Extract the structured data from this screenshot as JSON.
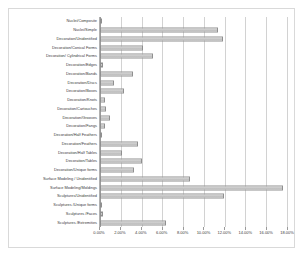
{
  "chart_data": {
    "type": "bar",
    "orientation": "horizontal",
    "title": "",
    "xlabel": "",
    "ylabel": "",
    "xlim": [
      0,
      18
    ],
    "xtick_labels": [
      "0.00%",
      "2.00%",
      "4.00%",
      "6.00%",
      "8.00%",
      "10.00%",
      "12.00%",
      "14.00%",
      "16.00%",
      "18.00%"
    ],
    "xtick_values": [
      0,
      2,
      4,
      6,
      8,
      10,
      12,
      14,
      16,
      18
    ],
    "grid": true,
    "legend": "none",
    "value_unit": "%",
    "categories": [
      "Nuclei/Composite",
      "Nuclei/Simple",
      "Decoration/Unidentified",
      "Decoration/Conical Forms",
      "Decoration/ Cylindrical Forms",
      "Decoration/Edges",
      "Decoration/Bands",
      "Decoration/Discs",
      "Decoration/Boxes",
      "Decoration/Knots",
      "Decoration/Cartouches",
      "Decoration/Grooves",
      "Decoration/Fangs",
      "Decoration/Half Feathers",
      "Decoration/Feathers",
      "Decoration/Half Tables",
      "Decoration/Tables",
      "Decoration/Unique forms",
      "Surface Modeling / Unidentified",
      "Surface Modeling/Moldings",
      "Sculptures/Unidentified",
      "Sculptures /Unique forms",
      "Sculptures /Faces",
      "Sculptures /Extremities"
    ],
    "values": [
      0.2,
      11.4,
      11.8,
      4.1,
      5.1,
      0.3,
      3.2,
      1.3,
      2.3,
      0.5,
      0.6,
      1.0,
      0.5,
      0.1,
      3.7,
      2.1,
      4.0,
      3.3,
      8.7,
      17.6,
      11.9,
      0.15,
      0.3,
      6.4
    ]
  },
  "style": {
    "bar_fill": "#b4b4b4",
    "bar_border": "#8f8f8f",
    "grid_color": "#d2d2d2",
    "axis_color": "#9a9a9a",
    "text_color": "#3a3a3a",
    "frame_color": "#d9d9d9"
  }
}
